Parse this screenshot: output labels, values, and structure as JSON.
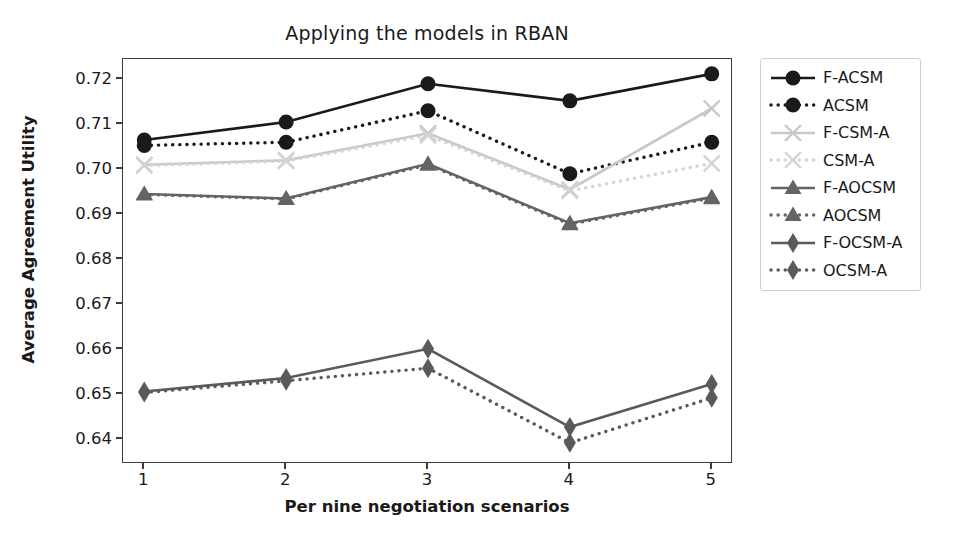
{
  "chart_data": {
    "type": "line",
    "title": "Applying the models in RBAN",
    "xlabel": "Per nine negotiation scenarios",
    "ylabel": "Average Agreement Utility",
    "x": [
      1,
      2,
      3,
      4,
      5
    ],
    "xtick_labels": [
      "1",
      "2",
      "3",
      "4",
      "5"
    ],
    "ytick_labels": [
      "0.64",
      "0.65",
      "0.66",
      "0.67",
      "0.68",
      "0.69",
      "0.70",
      "0.71",
      "0.72"
    ],
    "ytick_values": [
      0.64,
      0.65,
      0.66,
      0.67,
      0.68,
      0.69,
      0.7,
      0.71,
      0.72
    ],
    "ylim": [
      0.6345,
      0.7245
    ],
    "xlim": [
      0.85,
      5.15
    ],
    "grid": false,
    "legend_position": "outside-right-top",
    "series": [
      {
        "name": "F-ACSM",
        "marker": "circle",
        "linestyle": "solid",
        "color": "#1a1a1a",
        "values": [
          0.7065,
          0.7105,
          0.719,
          0.7152,
          0.7212
        ]
      },
      {
        "name": "ACSM",
        "marker": "circle",
        "linestyle": "dotted",
        "color": "#1a1a1a",
        "values": [
          0.7053,
          0.706,
          0.713,
          0.699,
          0.706
        ]
      },
      {
        "name": "F-CSM-A",
        "marker": "x",
        "linestyle": "solid",
        "color": "#c8c8c8",
        "values": [
          0.701,
          0.702,
          0.708,
          0.6955,
          0.7135
        ]
      },
      {
        "name": "CSM-A",
        "marker": "x",
        "linestyle": "dotted",
        "color": "#d4d4d4",
        "values": [
          0.7008,
          0.7018,
          0.7075,
          0.6952,
          0.7013
        ]
      },
      {
        "name": "F-AOCSM",
        "marker": "triangle",
        "linestyle": "solid",
        "color": "#646464",
        "values": [
          0.6945,
          0.6935,
          0.7012,
          0.688,
          0.6938
        ]
      },
      {
        "name": "AOCSM",
        "marker": "triangle",
        "linestyle": "dotted",
        "color": "#646464",
        "values": [
          0.6944,
          0.6934,
          0.701,
          0.6878,
          0.6936
        ]
      },
      {
        "name": "F-OCSM-A",
        "marker": "diamond",
        "linestyle": "solid",
        "color": "#5a5a5a",
        "values": [
          0.6506,
          0.6536,
          0.6601,
          0.6427,
          0.6523
        ]
      },
      {
        "name": "OCSM-A",
        "marker": "diamond",
        "linestyle": "dotted",
        "color": "#5a5a5a",
        "values": [
          0.6504,
          0.653,
          0.6558,
          0.6392,
          0.6492
        ]
      }
    ]
  }
}
